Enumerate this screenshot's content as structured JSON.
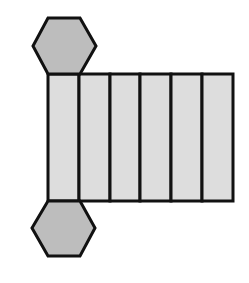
{
  "diagram": {
    "title": "Net of a hexagonal prism",
    "colors": {
      "hex_fill": "#bdbdbd",
      "face_fill": "#dddddd",
      "stroke": "#111111",
      "background": "#ffffff"
    },
    "hexagons": [
      {
        "name": "top-base",
        "points": "48,18 80,18 96,46 80,74 48,74 33,46"
      },
      {
        "name": "bottom-base",
        "points": "48,201 80,201 95,228 80,256 48,256 32,228"
      }
    ],
    "lateral_faces": {
      "count": 6,
      "y_top": 74,
      "y_bottom": 201,
      "x_edges": [
        48,
        79,
        110,
        140,
        171,
        202,
        233
      ]
    }
  }
}
